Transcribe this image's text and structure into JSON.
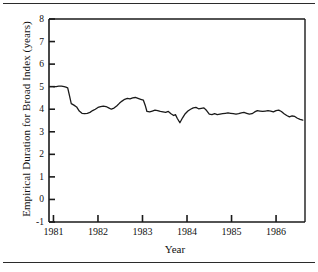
{
  "figure": {
    "background_color": "#ffffff",
    "line_color": "#1a1a1a",
    "axis_color": "#1a1a1a",
    "rule_color": "#2b2b2b",
    "top_rule": "horizontal-rule",
    "bottom_rule": "horizontal-rule"
  },
  "chart_data": {
    "type": "line",
    "title": "",
    "xlabel": "Year",
    "ylabel": "Empirical Duration for Broad Index (years)",
    "xlim": [
      1980.9,
      1986.65
    ],
    "ylim": [
      -1,
      8
    ],
    "grid": false,
    "legend": "none",
    "ytick_labels": [
      "8",
      "7",
      "6",
      "5",
      "4",
      "3",
      "2",
      "1",
      "0",
      "-1"
    ],
    "ytick_values": [
      8,
      7,
      6,
      5,
      4,
      3,
      2,
      1,
      0,
      -1
    ],
    "xtick_labels": [
      "1981",
      "1982",
      "1983",
      "1984",
      "1985",
      "1986"
    ],
    "xtick_values": [
      1981,
      1982,
      1983,
      1984,
      1985,
      1986
    ],
    "series": [
      {
        "name": "Empirical Duration for Broad Index",
        "x": [
          1981.0,
          1981.06,
          1981.12,
          1981.18,
          1981.24,
          1981.28,
          1981.32,
          1981.36,
          1981.4,
          1981.46,
          1981.52,
          1981.58,
          1981.64,
          1981.7,
          1981.76,
          1981.82,
          1981.88,
          1981.94,
          1982.0,
          1982.06,
          1982.12,
          1982.18,
          1982.24,
          1982.3,
          1982.36,
          1982.42,
          1982.48,
          1982.54,
          1982.6,
          1982.66,
          1982.72,
          1982.78,
          1982.84,
          1982.9,
          1982.96,
          1983.02,
          1983.06,
          1983.1,
          1983.16,
          1983.22,
          1983.28,
          1983.34,
          1983.4,
          1983.46,
          1983.52,
          1983.58,
          1983.64,
          1983.7,
          1983.74,
          1983.78,
          1983.84,
          1983.9,
          1983.96,
          1984.02,
          1984.08,
          1984.14,
          1984.2,
          1984.26,
          1984.32,
          1984.38,
          1984.44,
          1984.5,
          1984.56,
          1984.62,
          1984.68,
          1984.74,
          1984.8,
          1984.86,
          1984.92,
          1984.98,
          1985.04,
          1985.1,
          1985.16,
          1985.22,
          1985.28,
          1985.34,
          1985.4,
          1985.46,
          1985.52,
          1985.58,
          1985.64,
          1985.7,
          1985.76,
          1985.82,
          1985.88,
          1985.94,
          1986.0,
          1986.06,
          1986.12,
          1986.18,
          1986.24,
          1986.3,
          1986.36,
          1986.42,
          1986.48,
          1986.54,
          1986.6
        ],
        "values": [
          5.0,
          5.0,
          5.02,
          5.02,
          5.0,
          4.98,
          4.95,
          4.6,
          4.25,
          4.18,
          4.1,
          3.92,
          3.82,
          3.8,
          3.82,
          3.86,
          3.94,
          4.0,
          4.08,
          4.12,
          4.14,
          4.12,
          4.06,
          4.0,
          4.05,
          4.14,
          4.26,
          4.36,
          4.44,
          4.48,
          4.46,
          4.5,
          4.52,
          4.48,
          4.44,
          4.4,
          4.18,
          3.9,
          3.88,
          3.92,
          3.96,
          3.94,
          3.9,
          3.88,
          3.86,
          3.9,
          3.8,
          3.72,
          3.76,
          3.6,
          3.4,
          3.62,
          3.8,
          3.92,
          4.0,
          4.06,
          4.08,
          4.02,
          4.04,
          4.06,
          3.94,
          3.78,
          3.76,
          3.8,
          3.76,
          3.78,
          3.8,
          3.82,
          3.84,
          3.82,
          3.8,
          3.78,
          3.8,
          3.84,
          3.86,
          3.82,
          3.78,
          3.8,
          3.88,
          3.94,
          3.92,
          3.9,
          3.92,
          3.94,
          3.92,
          3.88,
          3.94,
          3.96,
          3.9,
          3.8,
          3.72,
          3.66,
          3.7,
          3.68,
          3.6,
          3.55,
          3.52
        ]
      }
    ]
  }
}
